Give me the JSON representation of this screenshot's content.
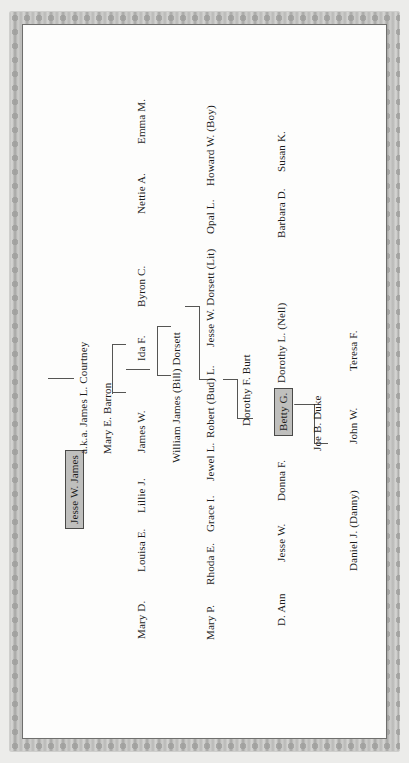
{
  "document": {
    "type": "family-tree-chart",
    "orientation": "rotated-90-counterclockwise",
    "frame_style": "decorative scalloped gray border",
    "colors": {
      "page_background": "#ececea",
      "canvas": "#fdfdfc",
      "frame": "#bdbdbb",
      "frame_shadow": "#9e9e9c",
      "text": "#1b1b1b",
      "connector_line": "#555553",
      "highlight_box_fill": "#bfbfbd",
      "highlight_box_border": "#4a4a48"
    }
  },
  "generations": [
    {
      "id": "gen-1",
      "index": 1,
      "people": [
        {
          "id": "p-jesse-w-james",
          "name": "Jesse W. James",
          "highlighted": true
        },
        {
          "id": "p-aka-james-l-courtney",
          "name": "a.k.a. James L. Courtney",
          "highlighted": false
        }
      ]
    },
    {
      "id": "gen-2",
      "index": 2,
      "people": [
        {
          "id": "p-mary-e-barron",
          "name": "Mary E. Barron",
          "highlighted": false
        }
      ]
    },
    {
      "id": "gen-3",
      "index": 3,
      "people": [
        {
          "id": "p-mary-d",
          "name": "Mary D.",
          "highlighted": false
        },
        {
          "id": "p-louisa-e",
          "name": "Louisa E.",
          "highlighted": false
        },
        {
          "id": "p-lillie-j",
          "name": "Lillie J.",
          "highlighted": false
        },
        {
          "id": "p-james-w",
          "name": "James W.",
          "highlighted": false
        },
        {
          "id": "p-ida-f",
          "name": "Ida F.",
          "highlighted": false
        },
        {
          "id": "p-byron-c",
          "name": "Byron C.",
          "highlighted": false
        },
        {
          "id": "p-nettie-a",
          "name": "Nettie A.",
          "highlighted": false
        },
        {
          "id": "p-emma-m",
          "name": "Emma M.",
          "highlighted": false
        }
      ]
    },
    {
      "id": "gen-4",
      "index": 4,
      "people": [
        {
          "id": "p-william-james-bill-dorsett",
          "name": "William James (Bill) Dorsett",
          "highlighted": false
        }
      ]
    },
    {
      "id": "gen-5",
      "index": 5,
      "people": [
        {
          "id": "p-mary-p",
          "name": "Mary P.",
          "highlighted": false
        },
        {
          "id": "p-rhoda-e",
          "name": "Rhoda E.",
          "highlighted": false
        },
        {
          "id": "p-grace-i",
          "name": "Grace I.",
          "highlighted": false
        },
        {
          "id": "p-jewel-l",
          "name": "Jewel L.",
          "highlighted": false
        },
        {
          "id": "p-robert-bud-l",
          "name": "Robert (Bud) L.",
          "highlighted": false
        },
        {
          "id": "p-jesse-w-dorsett-lit",
          "name": "Jesse W. Dorsett (Lit)",
          "highlighted": false
        },
        {
          "id": "p-opal-l",
          "name": "Opal L.",
          "highlighted": false
        },
        {
          "id": "p-howard-w-boy",
          "name": "Howard W. (Boy)",
          "highlighted": false
        }
      ]
    },
    {
      "id": "gen-6",
      "index": 6,
      "people": [
        {
          "id": "p-dorothy-f-burt",
          "name": "Dorothy F. Burt",
          "highlighted": false
        }
      ]
    },
    {
      "id": "gen-7",
      "index": 7,
      "people": [
        {
          "id": "p-d-ann",
          "name": "D. Ann",
          "highlighted": false
        },
        {
          "id": "p-jesse-w-2",
          "name": "Jesse W.",
          "highlighted": false
        },
        {
          "id": "p-donna-f",
          "name": "Donna F.",
          "highlighted": false
        },
        {
          "id": "p-betty-g",
          "name": "Betty G.",
          "highlighted": true
        },
        {
          "id": "p-dorothy-l-nell",
          "name": "Dorothy L. (Nell)",
          "highlighted": false
        },
        {
          "id": "p-barbara-d",
          "name": "Barbara D.",
          "highlighted": false
        },
        {
          "id": "p-susan-k",
          "name": "Susan K.",
          "highlighted": false
        }
      ]
    },
    {
      "id": "gen-8",
      "index": 8,
      "people": [
        {
          "id": "p-joe-b-duke",
          "name": "Joe B. Duke",
          "highlighted": false
        }
      ]
    },
    {
      "id": "gen-9",
      "index": 9,
      "people": [
        {
          "id": "p-daniel-j-danny",
          "name": "Daniel J. (Danny)",
          "highlighted": false
        },
        {
          "id": "p-john-w",
          "name": "John W.",
          "highlighted": false
        },
        {
          "id": "p-teresa-f",
          "name": "Teresa F.",
          "highlighted": false
        }
      ]
    }
  ],
  "unions": [
    {
      "id": "u-1",
      "label": "Jesse W. James + Mary E. Barron",
      "child_generation": "gen-3"
    },
    {
      "id": "u-2",
      "label": "James W. + Ida F. (to William James Dorsett)",
      "child_generation": "gen-4"
    },
    {
      "id": "u-3",
      "label": "William James (Bill) Dorsett union",
      "child_generation": "gen-5"
    },
    {
      "id": "u-4",
      "label": "Jesse W. Dorsett (Lit) + Dorothy F. Burt",
      "child_generation": "gen-7"
    },
    {
      "id": "u-5",
      "label": "Betty G. + Joe B. Duke",
      "child_generation": "gen-9"
    }
  ]
}
